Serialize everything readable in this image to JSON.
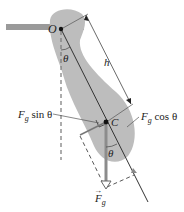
{
  "figure": {
    "type": "physical-pendulum-free-body-diagram",
    "colors": {
      "body_fill": "#bdbdbd",
      "support_bar": "#9a9a9a",
      "line": "#333333",
      "force_arrow": "#8c8c8c",
      "dashed": "#555555",
      "text": "#222222"
    }
  },
  "labels": {
    "pivot": "O",
    "center_of_mass": "C",
    "distance": "h",
    "theta_top": "θ",
    "theta_bottom": "θ",
    "sin_component": {
      "F": "F",
      "sub": "g",
      "rest": " sin θ"
    },
    "cos_component": {
      "F": "F",
      "sub": "g",
      "rest": " cos θ"
    },
    "gravity": {
      "arrow": "→",
      "F": "F",
      "sub": "g"
    }
  }
}
